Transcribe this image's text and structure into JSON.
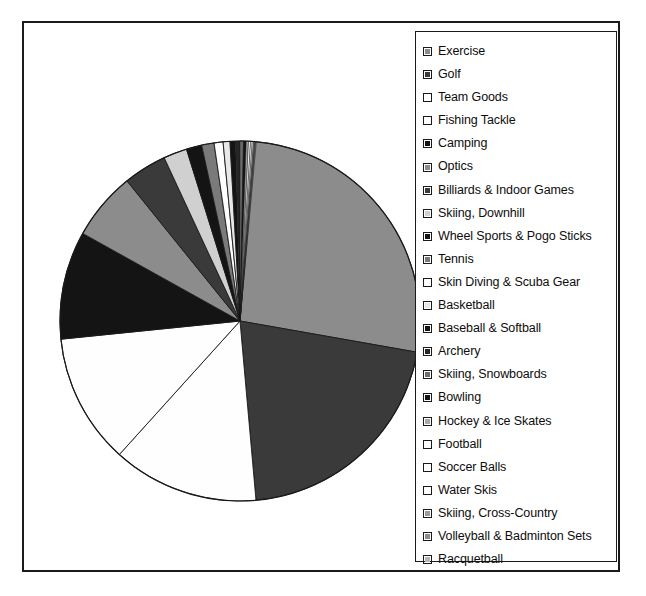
{
  "chart_data": {
    "type": "pie",
    "title": "",
    "legend_position": "right",
    "start_angle_deg": 0,
    "direction": "clockwise",
    "categories": [
      "Exercise",
      "Golf",
      "Team Goods",
      "Fishing Tackle",
      "Camping",
      "Optics",
      "Billiards & Indoor Games",
      "Skiing, Downhill",
      "Wheel Sports & Pogo Sticks",
      "Tennis",
      "Skin Diving & Scuba Gear",
      "Basketball",
      "Baseball & Softball",
      "Archery",
      "Skiing, Snowboards",
      "Bowling",
      "Hockey & Ice Skates",
      "Football",
      "Soccer Balls",
      "Water Skis",
      "Skiing, Cross-Country",
      "Volleyball & Badminton Sets",
      "Racquetball"
    ],
    "values": [
      27.8,
      20.8,
      13.1,
      11.7,
      9.7,
      6.1,
      3.9,
      2.1,
      1.4,
      1.1,
      0.8,
      0.6,
      0.5,
      0.4,
      0.3,
      0.25,
      0.2,
      0.18,
      0.15,
      0.12,
      0.1,
      0.08,
      0.06
    ],
    "angles_deg": [
      100.0,
      74.9,
      47.2,
      42.1,
      34.9,
      22.0,
      14.0,
      7.6,
      5.0,
      4.0,
      2.9,
      2.2,
      1.8,
      1.4,
      1.1,
      0.9,
      0.72,
      0.65,
      0.54,
      0.43,
      0.36,
      0.29,
      0.22
    ],
    "slice_fills": [
      "#8c8c8c",
      "#3a3a3a",
      "#fefefe",
      "#fefefe",
      "#141414",
      "#8c8c8c",
      "#3a3a3a",
      "#d0d0d0",
      "#141414",
      "#7a7a7a",
      "#fefefe",
      "#e8e8e8",
      "#141414",
      "#262626",
      "#6e6e6e",
      "#141414",
      "#a8a8a8",
      "#fefefe",
      "#fefefe",
      "#fefefe",
      "#9a9a9a",
      "#8c8c8c",
      "#b5b5b5"
    ],
    "ylabel": "",
    "xlabel": ""
  },
  "legend": {
    "items": [
      {
        "label": "Exercise",
        "swatch": "#8c8c8c"
      },
      {
        "label": "Golf",
        "swatch": "#3a3a3a"
      },
      {
        "label": "Team Goods",
        "swatch": "#ffffff"
      },
      {
        "label": "Fishing Tackle",
        "swatch": "#ffffff"
      },
      {
        "label": "Camping",
        "swatch": "#141414"
      },
      {
        "label": "Optics",
        "swatch": "#8c8c8c"
      },
      {
        "label": "Billiards & Indoor Games",
        "swatch": "#3a3a3a"
      },
      {
        "label": "Skiing, Downhill",
        "swatch": "#d0d0d0"
      },
      {
        "label": "Wheel Sports & Pogo Sticks",
        "swatch": "#141414"
      },
      {
        "label": "Tennis",
        "swatch": "#7a7a7a"
      },
      {
        "label": "Skin Diving & Scuba Gear",
        "swatch": "#ffffff"
      },
      {
        "label": "Basketball",
        "swatch": "#e8e8e8"
      },
      {
        "label": "Baseball & Softball",
        "swatch": "#141414"
      },
      {
        "label": "Archery",
        "swatch": "#262626"
      },
      {
        "label": "Skiing, Snowboards",
        "swatch": "#6e6e6e"
      },
      {
        "label": "Bowling",
        "swatch": "#141414"
      },
      {
        "label": "Hockey & Ice Skates",
        "swatch": "#a8a8a8"
      },
      {
        "label": "Football",
        "swatch": "#ffffff"
      },
      {
        "label": "Soccer Balls",
        "swatch": "#ffffff"
      },
      {
        "label": "Water Skis",
        "swatch": "#ffffff"
      },
      {
        "label": "Skiing, Cross-Country",
        "swatch": "#9a9a9a"
      },
      {
        "label": "Volleyball & Badminton Sets",
        "swatch": "#8c8c8c"
      },
      {
        "label": "Racquetball",
        "swatch": "#b5b5b5"
      }
    ]
  },
  "colors": {
    "frame_border": "#1a1a1a",
    "slice_outline": "#1a1a1a",
    "background": "#ffffff",
    "text": "#0d0d0d"
  }
}
